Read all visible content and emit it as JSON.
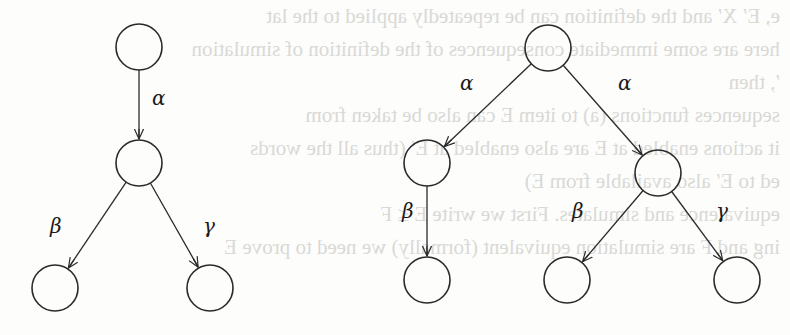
{
  "figure": {
    "node_radius": 23,
    "stroke_color": "#2a2a2a",
    "bleed_through_color": "#d9d9d6",
    "trees": [
      {
        "name": "left-tree",
        "nodes": [
          {
            "id": "L0",
            "x": 139,
            "y": 47
          },
          {
            "id": "L1",
            "x": 139,
            "y": 163
          },
          {
            "id": "L2",
            "x": 55,
            "y": 288
          },
          {
            "id": "L3",
            "x": 210,
            "y": 288
          }
        ],
        "edges": [
          {
            "from": "L0",
            "to": "L1",
            "label": "α",
            "lx": 152,
            "ly": 105
          },
          {
            "from": "L1",
            "to": "L2",
            "label": "β",
            "lx": 50,
            "ly": 233
          },
          {
            "from": "L1",
            "to": "L3",
            "label": "γ",
            "lx": 203,
            "ly": 233
          }
        ]
      },
      {
        "name": "right-tree",
        "nodes": [
          {
            "id": "R0",
            "x": 548,
            "y": 48
          },
          {
            "id": "R1",
            "x": 427,
            "y": 163
          },
          {
            "id": "R2",
            "x": 658,
            "y": 173
          },
          {
            "id": "R3",
            "x": 427,
            "y": 280
          },
          {
            "id": "R4",
            "x": 567,
            "y": 280
          },
          {
            "id": "R5",
            "x": 737,
            "y": 280
          }
        ],
        "edges": [
          {
            "from": "R0",
            "to": "R1",
            "label": "α",
            "lx": 460,
            "ly": 90
          },
          {
            "from": "R0",
            "to": "R2",
            "label": "α",
            "lx": 618,
            "ly": 90
          },
          {
            "from": "R1",
            "to": "R3",
            "label": "β",
            "lx": 402,
            "ly": 218
          },
          {
            "from": "R2",
            "to": "R4",
            "label": "β",
            "lx": 572,
            "ly": 218
          },
          {
            "from": "R2",
            "to": "R5",
            "label": "γ",
            "lx": 716,
            "ly": 218
          }
        ]
      }
    ]
  },
  "bleed_through_text": [
    "e, E′ X′ and the definition can be repeatedly applied to the lat",
    "here are some immediate consequences of the definition of simulation",
    "′, then",
    "sequences functions (a) to item E can also be taken from",
    "it actions enabled at E are also enabled at E′ (thus all the words",
    "ed to E′ also available from E)",
    "equivalence and simulates. First we write E ≤ F",
    "ing and F are simulation equivalent (formally) we need to prove E"
  ]
}
